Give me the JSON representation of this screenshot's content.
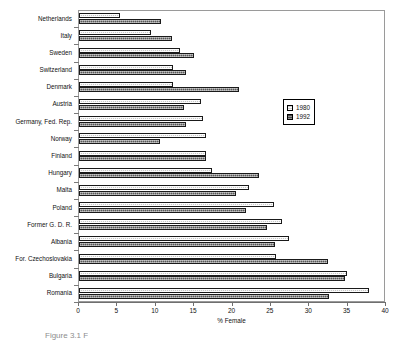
{
  "caption": "Figure 3.1 F",
  "legend": {
    "position": "inside-upper-right",
    "entries": [
      {
        "label": "1980",
        "color": "#d2d2d2",
        "swatch_name": "legend-swatch-1980"
      },
      {
        "label": "1992",
        "color": "#4a4a4a",
        "swatch_name": "legend-swatch-1992"
      }
    ]
  },
  "chart_data": {
    "type": "bar",
    "orientation": "horizontal",
    "title": "",
    "subtitle": "",
    "xlabel": "% Female",
    "ylabel": "",
    "xlim": [
      0,
      40
    ],
    "xticks": [
      0,
      5,
      10,
      15,
      20,
      25,
      30,
      35,
      40
    ],
    "xtick_labels": [
      "0",
      "5",
      "10",
      "15",
      "20",
      "25",
      "30",
      "35",
      "40"
    ],
    "grid": false,
    "categories": [
      "Netherlands",
      "Italy",
      "Sweden",
      "Switzerland",
      "Denmark",
      "Austria",
      "Germany, Fed. Rep.",
      "Norway",
      "Finland",
      "Hungary",
      "Malta",
      "Poland",
      "Former G. D. R.",
      "Albania",
      "For. Czechoslovakia",
      "Bulgaria",
      "Romania"
    ],
    "series": [
      {
        "name": "1980",
        "color": "#d2d2d2",
        "values": [
          5.4,
          9.4,
          13.2,
          12.3,
          12.3,
          15.9,
          16.1,
          16.5,
          16.6,
          17.3,
          22.2,
          25.4,
          26.5,
          27.3,
          25.7,
          34.9,
          37.8
        ]
      },
      {
        "name": "1992",
        "color": "#4a4a4a",
        "values": [
          10.7,
          12.1,
          15.0,
          14.0,
          20.9,
          13.7,
          13.9,
          10.6,
          16.5,
          23.4,
          20.5,
          21.8,
          24.5,
          25.6,
          32.5,
          34.6,
          32.6
        ]
      }
    ]
  }
}
